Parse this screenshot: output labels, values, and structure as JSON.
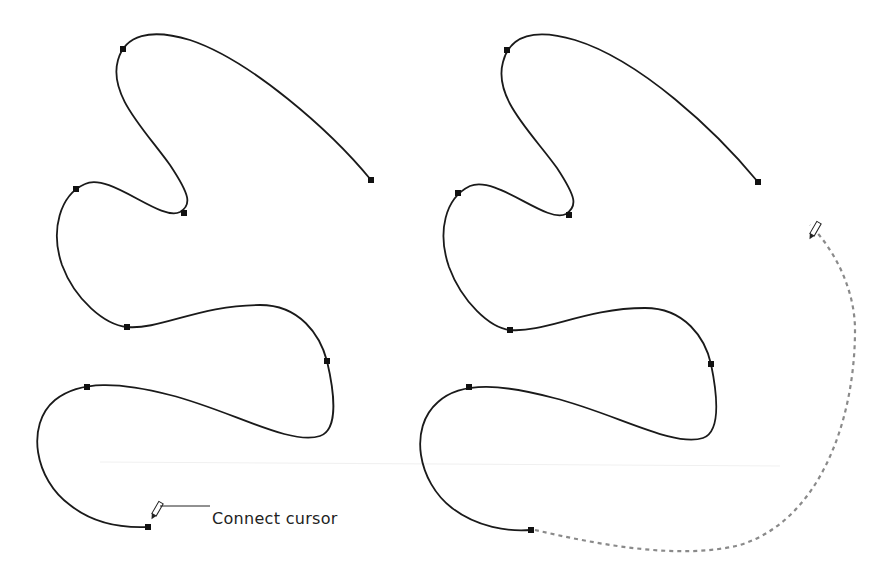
{
  "annotation": {
    "label": "Connect cursor"
  },
  "panels": [
    {
      "name": "before-connect",
      "cursor": "pencil-connect",
      "anchors": [
        [
          371,
          180
        ],
        [
          123,
          49
        ],
        [
          76,
          189
        ],
        [
          184,
          213
        ],
        [
          127,
          327
        ],
        [
          327,
          361
        ],
        [
          87,
          387
        ],
        [
          148,
          527
        ]
      ]
    },
    {
      "name": "after-connect-preview",
      "cursor": "pencil",
      "anchors": [
        [
          758,
          182
        ],
        [
          507,
          50
        ],
        [
          458,
          193
        ],
        [
          569,
          215
        ],
        [
          510,
          330
        ],
        [
          711,
          364
        ],
        [
          469,
          387
        ],
        [
          531,
          530
        ]
      ],
      "preview_path": "dashed"
    }
  ],
  "colors": {
    "stroke": "#1a1a1a",
    "preview": "#8a8a8a"
  }
}
